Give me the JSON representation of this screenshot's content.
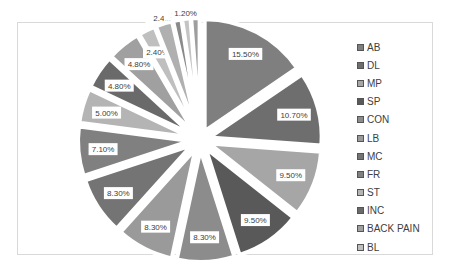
{
  "chart_data": {
    "type": "pie",
    "title": "",
    "exploded": true,
    "legend_position": "right",
    "categories": [
      "AB",
      "DL",
      "MP",
      "SP",
      "CON",
      "LB",
      "MC",
      "FR",
      "ST",
      "INC",
      "BACK PAIN",
      "BL"
    ],
    "values": [
      15.5,
      10.7,
      9.5,
      9.5,
      8.3,
      8.3,
      8.3,
      7.1,
      5.0,
      4.8,
      4.8,
      2.4
    ],
    "data_labels": [
      "15.50%",
      "10.70%",
      "9.50%",
      "9.50%",
      "8.30%",
      "8.30%",
      "8.30%",
      "7.10%",
      "5.00%",
      "4.80%",
      "4.80%",
      "2.40%"
    ],
    "extra_small_slices": {
      "values": [
        2.4,
        1.2,
        1.2,
        1.2
      ],
      "data_labels": [
        "2.4...",
        "1...",
        "1.20%",
        ""
      ]
    },
    "colors": [
      "#7f7f7f",
      "#6e6e6e",
      "#a6a6a6",
      "#595959",
      "#8c8c8c",
      "#9a9a9a",
      "#747474",
      "#808080",
      "#b4b4b4",
      "#6a6a6a",
      "#a0a0a0",
      "#bfbfbf"
    ]
  },
  "legend": {
    "items": [
      {
        "label": "AB",
        "color": "#7f7f7f"
      },
      {
        "label": "DL",
        "color": "#6e6e6e"
      },
      {
        "label": "MP",
        "color": "#a6a6a6"
      },
      {
        "label": "SP",
        "color": "#595959"
      },
      {
        "label": "CON",
        "color": "#8c8c8c"
      },
      {
        "label": "LB",
        "color": "#9a9a9a"
      },
      {
        "label": "MC",
        "color": "#747474"
      },
      {
        "label": "FR",
        "color": "#808080"
      },
      {
        "label": "ST",
        "color": "#b4b4b4"
      },
      {
        "label": "INC",
        "color": "#6a6a6a"
      },
      {
        "label": "BACK PAIN",
        "color": "#a0a0a0"
      },
      {
        "label": "BL",
        "color": "#bfbfbf"
      }
    ]
  }
}
